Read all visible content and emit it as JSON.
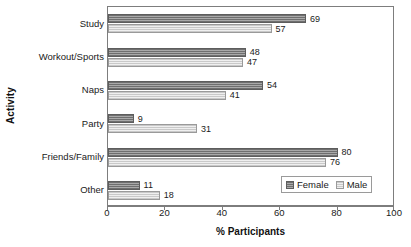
{
  "chart_data": {
    "type": "bar",
    "orientation": "horizontal",
    "title": "",
    "xlabel": "% Participants",
    "ylabel": "Activity",
    "xlim": [
      0,
      100
    ],
    "xticks": [
      0,
      20,
      40,
      60,
      80,
      100
    ],
    "xtick_labels": [
      "0",
      "20",
      "40",
      "60",
      "80",
      "100"
    ],
    "grid": false,
    "legend_position": "bottom-right",
    "categories": [
      "Study",
      "Workout/Sports",
      "Naps",
      "Party",
      "Friends/Family",
      "Other"
    ],
    "series": [
      {
        "name": "Female",
        "color": "#8e8e8e",
        "values": [
          69,
          48,
          54,
          9,
          80,
          11
        ],
        "value_labels": [
          "69",
          "48",
          "54",
          "9",
          "80",
          "11"
        ]
      },
      {
        "name": "Male",
        "color": "#dcdcdc",
        "values": [
          57,
          47,
          41,
          31,
          76,
          18
        ],
        "value_labels": [
          "57",
          "47",
          "41",
          "31",
          "76",
          "18"
        ]
      }
    ]
  },
  "legend": {
    "items": [
      {
        "label": "Female",
        "swatch": "female"
      },
      {
        "label": "Male",
        "swatch": "male"
      }
    ]
  }
}
